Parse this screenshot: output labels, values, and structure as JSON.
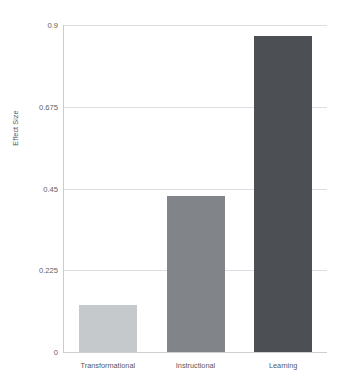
{
  "chart_data": {
    "type": "bar",
    "title": "",
    "xlabel": "",
    "ylabel": "Effect Size",
    "categories": [
      "Transformational",
      "Instructional",
      "Learning"
    ],
    "values": [
      0.13,
      0.43,
      0.87
    ],
    "ylim": [
      0,
      0.9
    ],
    "yticks": [
      "0",
      "0.225",
      "0.45",
      "0.675",
      "0.9"
    ],
    "ytick_values": [
      0,
      0.225,
      0.45,
      0.675,
      0.9
    ],
    "grid": true,
    "legend": "none",
    "series": [
      {
        "name": "Effect Size",
        "values": [
          0.13,
          0.43,
          0.87
        ]
      }
    ],
    "bar_colors": [
      "#c6c9cb",
      "#818589",
      "#4c5055"
    ]
  },
  "colors": {
    "background": "#ffffff",
    "gridline": "#dcdfe1",
    "axis": "#c9cccf",
    "text": "#55595c",
    "bar_light": "#c6c9cb",
    "bar_medium": "#818589",
    "bar_dark": "#4c5055"
  }
}
